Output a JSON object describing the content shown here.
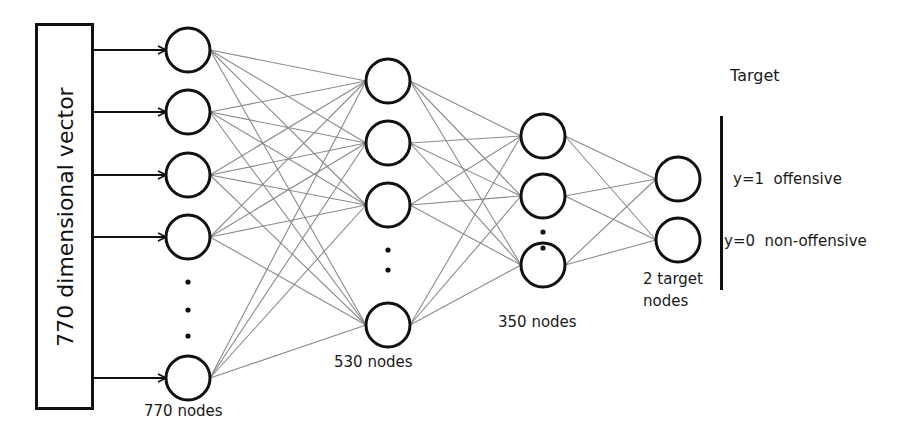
{
  "input": {
    "label": "770 dimensional vector"
  },
  "layers": [
    {
      "name": "input-layer",
      "label": "770 nodes",
      "x": 188,
      "nodes": [
        50,
        112,
        175,
        237,
        378
      ],
      "dots": [
        282,
        310,
        336
      ],
      "label_pos": [
        144,
        412
      ]
    },
    {
      "name": "hidden-layer-1",
      "label": "530 nodes",
      "x": 388,
      "nodes": [
        81,
        143,
        205,
        325
      ],
      "dots": [
        250,
        270
      ],
      "label_pos": [
        334,
        360
      ]
    },
    {
      "name": "hidden-layer-2",
      "label": "350 nodes",
      "x": 543,
      "nodes": [
        136,
        196,
        265
      ],
      "dots": [
        232,
        248
      ],
      "label_pos": [
        498,
        320
      ]
    },
    {
      "name": "output-layer",
      "label": "2 target\nnodes",
      "x": 678,
      "nodes": [
        179,
        240
      ],
      "dots": [],
      "label_pos": [
        641,
        275
      ]
    }
  ],
  "target": {
    "title": "Target",
    "classes": [
      {
        "label": "y=1  offensive",
        "y": 179
      },
      {
        "label": "y=0  non-offensive",
        "y": 240
      }
    ]
  },
  "style": {
    "node_radius": 22,
    "node_stroke": "#111111",
    "edge_color": "#8a8a8a",
    "arrow_color": "#111111"
  }
}
